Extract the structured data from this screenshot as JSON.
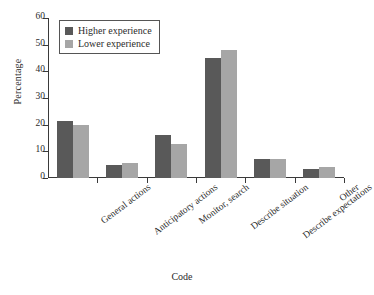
{
  "chart_data": {
    "type": "bar",
    "title": "",
    "xlabel": "Code",
    "ylabel": "Percentage",
    "ylim": [
      0,
      60
    ],
    "yticks": [
      0,
      10,
      20,
      30,
      40,
      50,
      60
    ],
    "grid": false,
    "legend_position": "top-left",
    "categories": [
      "General actions",
      "Anticipatory actions",
      "Monitor, search",
      "Describe situation",
      "Describe expectations",
      "Other"
    ],
    "series": [
      {
        "name": "Higher experience",
        "color": "#595959",
        "values": [
          21.5,
          5.0,
          16.0,
          45.0,
          7.0,
          3.5
        ]
      },
      {
        "name": "Lower experience",
        "color": "#a6a6a6",
        "values": [
          20.0,
          5.5,
          12.8,
          48.0,
          7.0,
          4.0
        ]
      }
    ]
  }
}
